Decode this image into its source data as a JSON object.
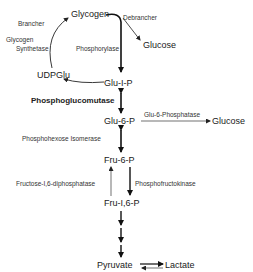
{
  "diagram": {
    "nodes": {
      "glycogen": "Glycogen",
      "glucose_top": "Glucose",
      "udpglu": "UDPGlu",
      "glu1p": "Glu-I-P",
      "glu6p": "Glu-6-P",
      "glucose_right": "Glucose",
      "fru6p": "Fru-6-P",
      "fru16p": "Fru-I,6-P",
      "pyruvate": "Pyruvate",
      "lactate": "Lactate"
    },
    "enzymes": {
      "brancher": "Brancher",
      "glycogen_synthetase_1": "Glycogen",
      "glycogen_synthetase_2": "Synthetase",
      "debrancher": "Debrancher",
      "phosphorylase": "Phosphorylase",
      "phosphoglucomutase": "Phosphoglucomutase",
      "glu6_phosphatase": "Glu-6-Phosphatase",
      "phosphohexose_isomerase": "Phosphohexose Isomerase",
      "fructose_diphosphatase": "Fructose-I,6-diphosphatase",
      "phosphofructokinase": "Phosphofructokinase"
    }
  }
}
